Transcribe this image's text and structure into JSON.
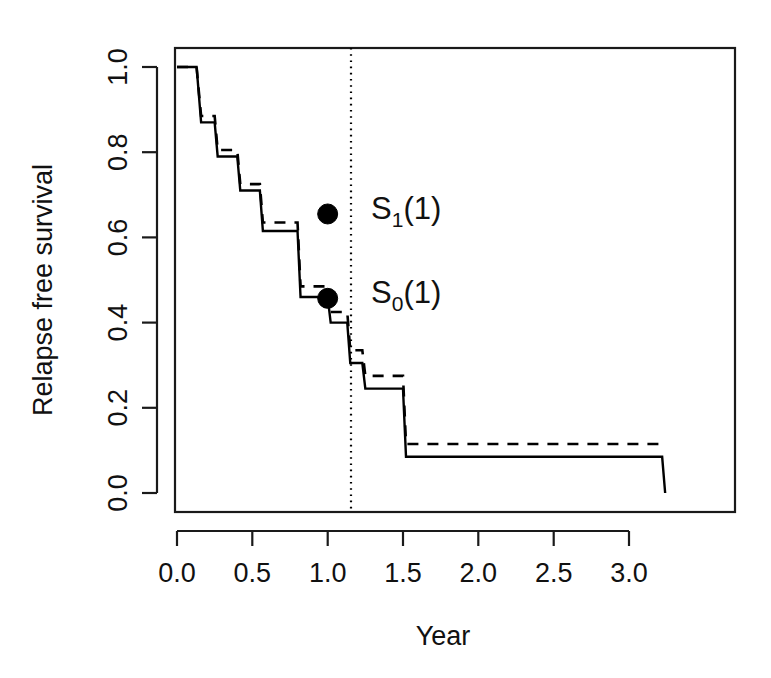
{
  "chart_data": {
    "type": "line",
    "title": "",
    "subtitle": "",
    "xlabel": "Year",
    "ylabel": "Relapse free survival",
    "xlim": [
      -0.13,
      3.57
    ],
    "ylim": [
      -0.075,
      1.08
    ],
    "xticks": [
      0.0,
      0.5,
      1.0,
      1.5,
      2.0,
      2.5,
      3.0
    ],
    "xticklabels": [
      "0.0",
      "0.5",
      "1.0",
      "1.5",
      "2.0",
      "2.5",
      "3.0"
    ],
    "yticks": [
      0.0,
      0.2,
      0.4,
      0.6,
      0.8,
      1.0
    ],
    "yticklabels": [
      "0.0",
      "0.2",
      "0.4",
      "0.6",
      "0.8",
      "1.0"
    ],
    "grid": false,
    "legend": "none",
    "frame": "box",
    "step_shape": "post",
    "series": [
      {
        "name": "solid-survival-curve",
        "style": "solid",
        "color": "#000000",
        "x": [
          0.0,
          0.13,
          0.16,
          0.25,
          0.27,
          0.4,
          0.42,
          0.55,
          0.57,
          0.8,
          0.82,
          1.0,
          1.02,
          1.13,
          1.15,
          1.23,
          1.25,
          1.5,
          1.52,
          3.22,
          3.24
        ],
        "y": [
          1.0,
          1.0,
          0.87,
          0.87,
          0.79,
          0.79,
          0.71,
          0.71,
          0.615,
          0.615,
          0.46,
          0.46,
          0.4,
          0.4,
          0.305,
          0.305,
          0.245,
          0.245,
          0.085,
          0.085,
          0.0
        ]
      },
      {
        "name": "dashed-survival-curve",
        "style": "dashed",
        "color": "#000000",
        "x": [
          0.0,
          0.13,
          0.16,
          0.25,
          0.27,
          0.4,
          0.42,
          0.55,
          0.57,
          0.8,
          0.82,
          1.0,
          1.02,
          1.13,
          1.15,
          1.23,
          1.25,
          1.5,
          1.52,
          3.24
        ],
        "y": [
          1.0,
          1.0,
          0.885,
          0.885,
          0.805,
          0.805,
          0.725,
          0.725,
          0.635,
          0.635,
          0.485,
          0.485,
          0.425,
          0.425,
          0.335,
          0.335,
          0.275,
          0.275,
          0.115,
          0.115
        ]
      }
    ],
    "reference_lines": [
      {
        "name": "vertical-year-one",
        "orientation": "vertical",
        "x": 1.0,
        "style": "dotted"
      }
    ],
    "annotations": [
      {
        "name": "s1-point",
        "label_base": "S",
        "label_sub": "1",
        "label_tail": "(1)",
        "label_full": "S_1(1)",
        "x": 1.0,
        "y": 0.655,
        "marker": "filled-circle"
      },
      {
        "name": "s0-point",
        "label_base": "S",
        "label_sub": "0",
        "label_tail": "(1)",
        "label_full": "S_0(1)",
        "x": 1.0,
        "y": 0.457,
        "marker": "filled-circle"
      }
    ]
  },
  "figure": {
    "background": "#ffffff",
    "foreground": "#111111",
    "accent": "#000000"
  }
}
